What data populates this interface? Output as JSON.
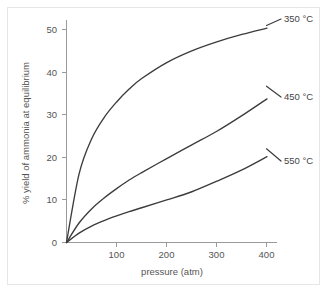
{
  "chart_data": {
    "type": "line",
    "title": "",
    "xlabel": "pressure (atm)",
    "ylabel": "% yield of ammonia at equilibrium",
    "xlim": [
      0,
      420
    ],
    "ylim": [
      0,
      57
    ],
    "grid": false,
    "legend_position": "inline-right",
    "xticks": [
      100,
      200,
      300,
      400
    ],
    "yticks": [
      0,
      10,
      20,
      30,
      40,
      50
    ],
    "xtick_labels": [
      "100",
      "200",
      "300",
      "400"
    ],
    "ytick_labels": [
      "0",
      "10",
      "20",
      "30",
      "40",
      "50"
    ],
    "x": [
      0,
      25,
      50,
      75,
      100,
      125,
      150,
      200,
      250,
      300,
      350,
      400
    ],
    "series": [
      {
        "name": "350 °C",
        "label": "350 °C",
        "color": "#3c3c3c",
        "values": [
          0,
          17.5,
          26.5,
          32.0,
          36.0,
          39.3,
          42.0,
          46.1,
          49.1,
          51.4,
          53.3,
          54.9
        ]
      },
      {
        "name": "450 °C",
        "label": "450 °C",
        "color": "#3c3c3c",
        "values": [
          0,
          5.0,
          8.6,
          11.4,
          13.8,
          16.0,
          17.9,
          21.5,
          25.0,
          28.5,
          32.5,
          36.8
        ]
      },
      {
        "name": "550 °C",
        "label": "550 °C",
        "color": "#3c3c3c",
        "values": [
          0,
          2.4,
          4.2,
          5.6,
          6.8,
          7.9,
          8.9,
          10.9,
          13.0,
          15.7,
          18.6,
          22.0
        ]
      }
    ],
    "annotations": [
      {
        "text": "350 °C",
        "x": 400,
        "y": 54.9
      },
      {
        "text": "450 °C",
        "x": 400,
        "y": 36.8
      },
      {
        "text": "550 °C",
        "x": 400,
        "y": 22.0
      }
    ]
  },
  "axes": {
    "y_title": "% yield of ammonia at equilibrium",
    "x_title": "pressure (atm)",
    "y_tick_0": "0",
    "y_tick_10": "10",
    "y_tick_20": "20",
    "y_tick_30": "30",
    "y_tick_40": "40",
    "y_tick_50": "50",
    "x_tick_100": "100",
    "x_tick_200": "200",
    "x_tick_300": "300",
    "x_tick_400": "400"
  },
  "labels": {
    "series_350": "350 °C",
    "series_450": "450 °C",
    "series_550": "550 °C"
  },
  "colors": {
    "background": "#ffffff",
    "frame": "#e6e6e6",
    "axis": "#9a9a9a",
    "curve": "#3c3c3c",
    "text": "#555555"
  }
}
